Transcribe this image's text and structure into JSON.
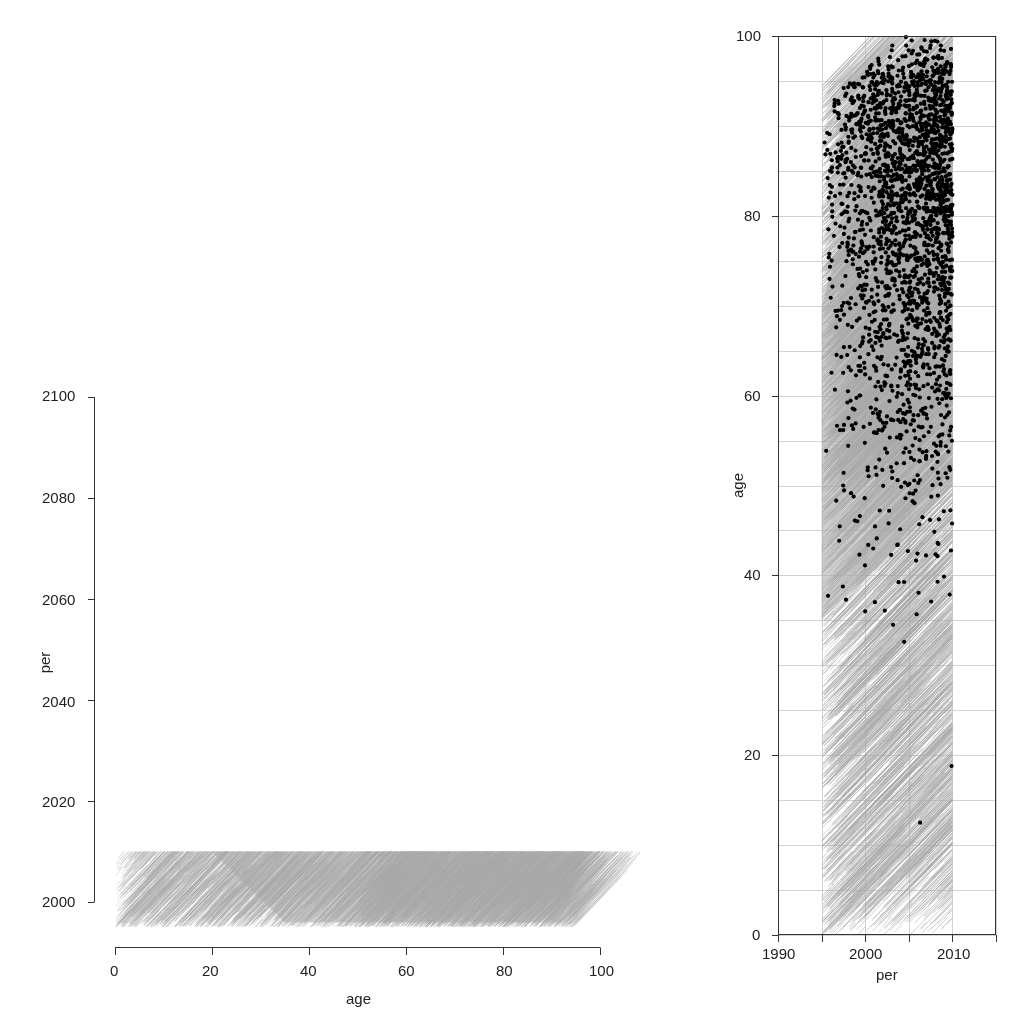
{
  "chart_data": [
    {
      "id": "left",
      "type": "line",
      "description": "Lexis lifelines plotted with age on x and period on y",
      "xlabel": "age",
      "ylabel": "per",
      "xlim": [
        0,
        100
      ],
      "ylim": [
        1995,
        2100
      ],
      "xticks": [
        0,
        20,
        40,
        60,
        80,
        100
      ],
      "yticks": [
        2000,
        2020,
        2040,
        2060,
        2080,
        2100
      ],
      "grid": false,
      "line_color": "#a8a8a8",
      "series": [
        {
          "name": "lifelines",
          "age_entry_range": [
            0,
            95
          ],
          "period_entry_range": [
            1995,
            2010
          ],
          "period_exit_max": 2010
        }
      ]
    },
    {
      "id": "right",
      "type": "scatter",
      "description": "Lexis diagram: period on x, age on y, lifelines grey with death events as black dots",
      "xlabel": "per",
      "ylabel": "age",
      "xlim": [
        1990,
        2015
      ],
      "ylim": [
        0,
        100
      ],
      "xticks": [
        1990,
        2000,
        2010
      ],
      "yticks": [
        0,
        20,
        40,
        60,
        80,
        100
      ],
      "grid": true,
      "grid_x_step": 5,
      "grid_y_step": 5,
      "line_color": "#a8a8a8",
      "point_color": "#000000",
      "series": [
        {
          "name": "lifelines",
          "period_range": [
            1995,
            2010
          ],
          "age_range": [
            0,
            100
          ]
        },
        {
          "name": "deaths",
          "approx_count": 2500,
          "age_concentration": [
            60,
            100
          ],
          "min_age_observed": 12
        }
      ]
    }
  ],
  "left_panel": {
    "xlabel": "age",
    "ylabel": "per",
    "xticks": [
      "0",
      "20",
      "40",
      "60",
      "80",
      "100"
    ],
    "yticks": [
      "2000",
      "2020",
      "2040",
      "2060",
      "2080",
      "2100"
    ]
  },
  "right_panel": {
    "xlabel": "per",
    "ylabel": "age",
    "xticks": [
      "1990",
      "2000",
      "2010"
    ],
    "yticks": [
      "0",
      "20",
      "40",
      "60",
      "80",
      "100"
    ]
  }
}
